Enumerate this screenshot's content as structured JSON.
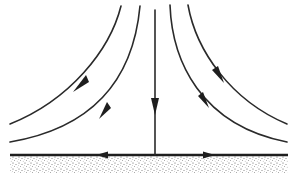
{
  "figure": {
    "colors": {
      "line": "#2a2a2a",
      "wall": "#1e1e1e",
      "ground_stipple": "#555555",
      "background": "#ffffff"
    },
    "streamlines": [
      {
        "id": "left-outer",
        "direction": "down-left"
      },
      {
        "id": "left-inner",
        "direction": "down-left"
      },
      {
        "id": "center",
        "direction": "down"
      },
      {
        "id": "right-inner",
        "direction": "down-right"
      },
      {
        "id": "right-outer",
        "direction": "down-right"
      }
    ],
    "wall_flow": [
      {
        "id": "wall-left",
        "direction": "left"
      },
      {
        "id": "wall-right",
        "direction": "right"
      }
    ]
  }
}
